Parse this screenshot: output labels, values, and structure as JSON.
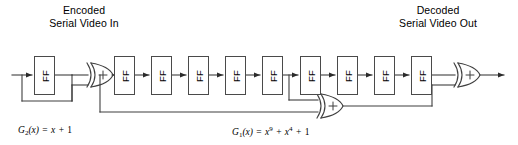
{
  "diagram": {
    "background_color": "#ffffff",
    "line_color": "#3f3f3f",
    "box_border_color": "#4a4a4a",
    "labels": {
      "input": {
        "line1": "Encoded",
        "line2": "Serial Video In"
      },
      "output": {
        "line1": "Decoded",
        "line2": "Serial Video Out"
      }
    },
    "formulas": {
      "g2": {
        "name": "G",
        "name_sub": "2",
        "arg": "(x)",
        "equals": "=",
        "term1": "x",
        "plus": "+",
        "term2": "1",
        "full_text": "G2(x) = x + 1"
      },
      "g1": {
        "name": "G",
        "name_sub": "1",
        "arg": "(x)",
        "equals": "=",
        "term1": "x",
        "term1_sup": "9",
        "plus1": "+",
        "term2": "x",
        "term2_sup": "4",
        "plus2": "+",
        "term3": "1",
        "full_text": "G1(x) = x9 + x4 + 1"
      }
    },
    "flipflops": [
      {
        "id": "g2-ff-1",
        "label": "FF",
        "x": 34,
        "y": 56,
        "stage": "g2"
      },
      {
        "id": "g1-ff-1",
        "label": "FF",
        "x": 114,
        "y": 56,
        "stage": "g1"
      },
      {
        "id": "g1-ff-2",
        "label": "FF",
        "x": 151,
        "y": 56,
        "stage": "g1"
      },
      {
        "id": "g1-ff-3",
        "label": "FF",
        "x": 188,
        "y": 56,
        "stage": "g1"
      },
      {
        "id": "g1-ff-4",
        "label": "FF",
        "x": 225,
        "y": 56,
        "stage": "g1"
      },
      {
        "id": "g1-ff-5",
        "label": "FF",
        "x": 262,
        "y": 56,
        "stage": "g1"
      },
      {
        "id": "g1-ff-6",
        "label": "FF",
        "x": 300,
        "y": 56,
        "stage": "g1"
      },
      {
        "id": "g1-ff-7",
        "label": "FF",
        "x": 337,
        "y": 56,
        "stage": "g1"
      },
      {
        "id": "g1-ff-8",
        "label": "FF",
        "x": 374,
        "y": 56,
        "stage": "g1"
      },
      {
        "id": "g1-ff-9",
        "label": "FF",
        "x": 411,
        "y": 56,
        "stage": "g1"
      }
    ],
    "xor_gates": [
      {
        "id": "xor-g2",
        "symbol": "+",
        "x": 88,
        "y": 75
      },
      {
        "id": "xor-feedback",
        "symbol": "+",
        "x": 318,
        "y": 106
      },
      {
        "id": "xor-output",
        "symbol": "+",
        "x": 455,
        "y": 75
      }
    ]
  }
}
